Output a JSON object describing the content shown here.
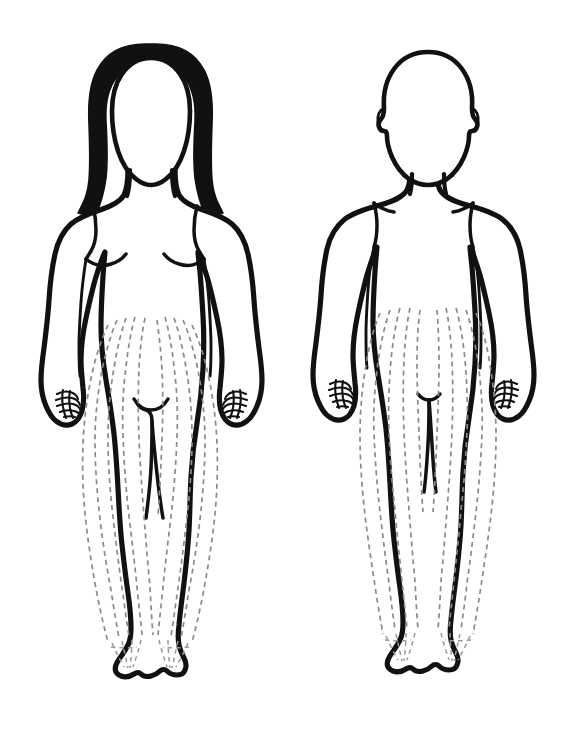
{
  "page": {
    "background_color": "#ffffff",
    "width": 571,
    "height": 740
  },
  "style": {
    "outline_color": "#111111",
    "hair_fill_color": "#111111",
    "dashed_line_color": "#8a8a8a",
    "body_fill_color": "#ffffff",
    "outline_stroke_width": 5.2,
    "dashed_stroke_width": 1.7,
    "dash_pattern": "5 4"
  },
  "figures": [
    {
      "id": "female-figure",
      "label": "Female figure, anterior view",
      "sex": "female",
      "view": "anterior",
      "position": "left",
      "center_x": 145,
      "hair": "long dark hair with widow's peak falling past the shoulders",
      "features": [
        "head-outline",
        "long-hair",
        "neck",
        "shoulders",
        "breast-contour-left",
        "breast-contour-right",
        "arms-at-sides",
        "hands-with-finger-detail",
        "pubic-triangle-mark",
        "legs",
        "feet-with-toes"
      ],
      "dashed_leg_lines": 10,
      "dashed_line_meaning": "leg hair distribution pattern"
    },
    {
      "id": "male-figure",
      "label": "Male figure, anterior view",
      "sex": "male",
      "view": "anterior",
      "position": "right",
      "center_x": 428,
      "hair": "short cropped hair, head drawn as plain outline with visible ears",
      "features": [
        "head-outline",
        "ears",
        "neck",
        "broad-shoulders",
        "pectoral-line-left",
        "pectoral-line-right",
        "arms-at-sides",
        "hands-with-finger-detail",
        "genital-mark",
        "legs",
        "feet-with-toes"
      ],
      "dashed_leg_lines": 10,
      "dashed_line_meaning": "leg hair distribution pattern"
    }
  ]
}
